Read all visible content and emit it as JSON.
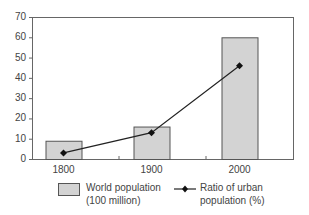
{
  "chart_data": {
    "type": "bar",
    "title": "",
    "xlabel": "",
    "ylabel": "",
    "categories": [
      "1800",
      "1900",
      "2000"
    ],
    "series": [
      {
        "name": "World population (100 million)",
        "kind": "bar",
        "values": [
          9,
          16,
          60
        ],
        "color": "#d3d3d3"
      },
      {
        "name": "Ratio of urban population (%)",
        "kind": "line",
        "marker": "diamond",
        "values": [
          3,
          13,
          46
        ],
        "color": "#222222"
      }
    ],
    "ylim": [
      0,
      70
    ],
    "yticks": [
      "0",
      "10",
      "20",
      "30",
      "40",
      "50",
      "60",
      "70"
    ],
    "grid": false,
    "legend_position": "bottom"
  },
  "legend": {
    "bar_line1": "World population",
    "bar_line2": "(100 million)",
    "line_line1": "Ratio of urban",
    "line_line2": "population (%)"
  }
}
